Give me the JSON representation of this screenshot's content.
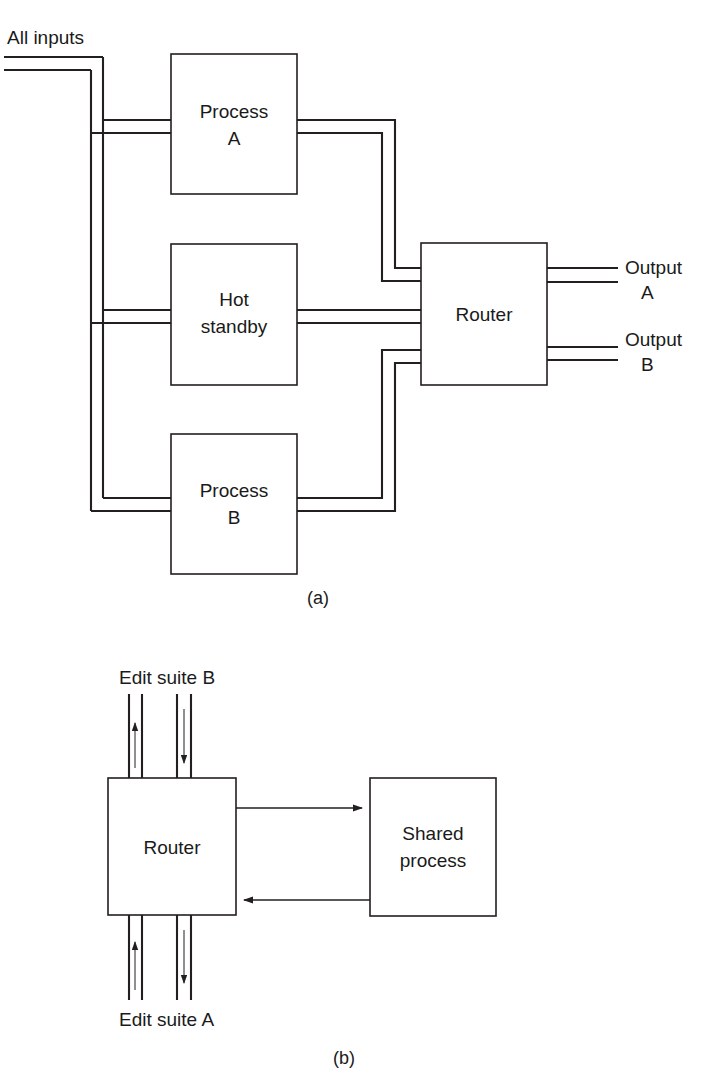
{
  "figure": {
    "title_visible": false,
    "background_color": "#ffffff",
    "line_color": "#231f20",
    "text_color": "#1a1a1a"
  },
  "panel_a": {
    "part_label": "(a)",
    "input_label": "All inputs",
    "blocks": [
      {
        "id": "process-a",
        "line1": "Process",
        "line2": "A"
      },
      {
        "id": "hot-standby",
        "line1": "Hot",
        "line2": "standby"
      },
      {
        "id": "process-b",
        "line1": "Process",
        "line2": "B"
      },
      {
        "id": "router-a",
        "line1": "Router",
        "line2": ""
      }
    ],
    "outputs": [
      {
        "id": "output-a",
        "line1": "Output",
        "line2": "A"
      },
      {
        "id": "output-b",
        "line1": "Output",
        "line2": "B"
      }
    ]
  },
  "panel_b": {
    "part_label": "(b)",
    "blocks": [
      {
        "id": "router-b",
        "line1": "Router",
        "line2": ""
      },
      {
        "id": "shared-process",
        "line1": "Shared",
        "line2": "process"
      }
    ],
    "edit_suite_top": "Edit suite B",
    "edit_suite_bottom": "Edit suite A"
  },
  "caption": {
    "text": ""
  }
}
